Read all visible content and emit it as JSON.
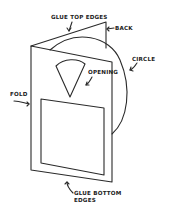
{
  "diagram": {
    "labels": {
      "glue_top": "GLUE TOP EDGES",
      "back": "BACK",
      "circle": "CIRCLE",
      "opening": "OPENING",
      "fold": "FOLD",
      "glue_bottom_1": "GLUE BOTTOM",
      "glue_bottom_2": "EDGES"
    },
    "colors": {
      "line": "#2a2a2a",
      "background": "#ffffff"
    }
  }
}
